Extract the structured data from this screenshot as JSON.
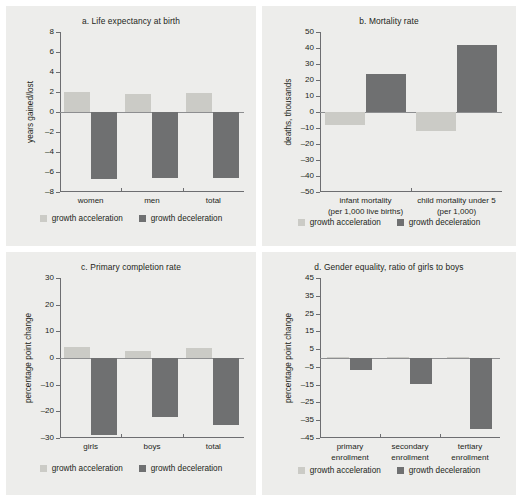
{
  "legend": {
    "acceleration_label": "growth acceleration",
    "deceleration_label": "growth deceleration",
    "acceleration_color": "#cbcbc6",
    "deceleration_color": "#6f7071"
  },
  "panels": {
    "a": {
      "title": "a.  Life expectancy at birth",
      "ylabel": "years gained/lost",
      "yticks": [
        "8",
        "6",
        "4",
        "2",
        "0",
        "–2",
        "–4",
        "–6",
        "–8"
      ],
      "categories": [
        "women",
        "men",
        "total"
      ],
      "acceleration": [
        "2.05",
        "1.8",
        "1.9"
      ],
      "deceleration": [
        "–6.7",
        "–6.6",
        "–6.6"
      ]
    },
    "b": {
      "title": "b.  Mortality rate",
      "ylabel": "deaths, thousands",
      "yticks": [
        "50",
        "40",
        "30",
        "20",
        "10",
        "0",
        "–10",
        "–20",
        "–30",
        "–40",
        "–50"
      ],
      "categories_line1": [
        "infant mortality",
        "child mortality under 5"
      ],
      "categories_line2": [
        "(per 1,000 live births)",
        "(per 1,000)"
      ],
      "acceleration": [
        "–8",
        "–12"
      ],
      "deceleration": [
        "24",
        "42"
      ]
    },
    "c": {
      "title": "c.  Primary completion rate",
      "ylabel": "percentage point change",
      "yticks": [
        "30",
        "20",
        "10",
        "0",
        "–10",
        "–20",
        "–30"
      ],
      "categories": [
        "girls",
        "boys",
        "total"
      ],
      "acceleration": [
        "4.2",
        "2.7",
        "3.6"
      ],
      "deceleration": [
        "–29",
        "–22",
        "–25"
      ]
    },
    "d": {
      "title": "d.  Gender equality, ratio of girls to boys",
      "ylabel": "percentage point change",
      "yticks": [
        "45",
        "35",
        "25",
        "15",
        "5",
        "–5",
        "–15",
        "–25",
        "–35",
        "–45"
      ],
      "categories_line1": [
        "primary",
        "secondary",
        "tertiary"
      ],
      "categories_line2": [
        "enrollment",
        "enrollment",
        "enrollment"
      ],
      "acceleration": [
        "0.8",
        "0.7",
        "0.8"
      ],
      "deceleration": [
        "–7",
        "–14.5",
        "–40"
      ]
    }
  },
  "chart_data": [
    {
      "type": "bar",
      "panel": "a",
      "title": "a.  Life expectancy at birth",
      "xlabel": "",
      "ylabel": "years gained/lost",
      "ylim": [
        -8,
        8
      ],
      "ytick_values": [
        8,
        6,
        4,
        2,
        0,
        -2,
        -4,
        -6,
        -8
      ],
      "grid": false,
      "legend_position": "bottom",
      "categories": [
        "women",
        "men",
        "total"
      ],
      "series": [
        {
          "name": "growth acceleration",
          "color": "#cbcbc6",
          "values": [
            2.05,
            1.8,
            1.9
          ]
        },
        {
          "name": "growth deceleration",
          "color": "#6f7071",
          "values": [
            -6.7,
            -6.6,
            -6.6
          ]
        }
      ]
    },
    {
      "type": "bar",
      "panel": "b",
      "title": "b.  Mortality rate",
      "xlabel": "",
      "ylabel": "deaths, thousands",
      "ylim": [
        -50,
        50
      ],
      "ytick_values": [
        50,
        40,
        30,
        20,
        10,
        0,
        -10,
        -20,
        -30,
        -40,
        -50
      ],
      "grid": false,
      "legend_position": "bottom",
      "categories": [
        "infant mortality (per 1,000 live births)",
        "child mortality under 5 (per 1,000)"
      ],
      "series": [
        {
          "name": "growth acceleration",
          "color": "#cbcbc6",
          "values": [
            -8,
            -12
          ]
        },
        {
          "name": "growth deceleration",
          "color": "#6f7071",
          "values": [
            24,
            42
          ]
        }
      ]
    },
    {
      "type": "bar",
      "panel": "c",
      "title": "c.  Primary completion rate",
      "xlabel": "",
      "ylabel": "percentage point change",
      "ylim": [
        -30,
        30
      ],
      "ytick_values": [
        30,
        20,
        10,
        0,
        -10,
        -20,
        -30
      ],
      "grid": false,
      "legend_position": "bottom",
      "categories": [
        "girls",
        "boys",
        "total"
      ],
      "series": [
        {
          "name": "growth acceleration",
          "color": "#cbcbc6",
          "values": [
            4.2,
            2.7,
            3.6
          ]
        },
        {
          "name": "growth deceleration",
          "color": "#6f7071",
          "values": [
            -29,
            -22,
            -25
          ]
        }
      ]
    },
    {
      "type": "bar",
      "panel": "d",
      "title": "d.  Gender equality, ratio of girls to boys",
      "xlabel": "",
      "ylabel": "percentage point change",
      "ylim": [
        -45,
        45
      ],
      "ytick_values": [
        45,
        35,
        25,
        15,
        5,
        -5,
        -15,
        -25,
        -35,
        -45
      ],
      "grid": false,
      "legend_position": "bottom",
      "categories": [
        "primary enrollment",
        "secondary enrollment",
        "tertiary enrollment"
      ],
      "series": [
        {
          "name": "growth acceleration",
          "color": "#cbcbc6",
          "values": [
            0.8,
            0.7,
            0.8
          ]
        },
        {
          "name": "growth deceleration",
          "color": "#6f7071",
          "values": [
            -7,
            -14.5,
            -40
          ]
        }
      ]
    }
  ]
}
